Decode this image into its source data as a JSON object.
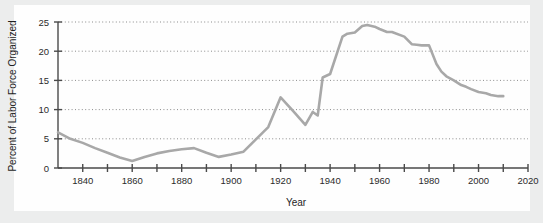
{
  "chart_data": {
    "type": "line",
    "title": "",
    "xlabel": "Year",
    "ylabel": "Percent of Labor Force Organized",
    "xlim": [
      1830,
      2020
    ],
    "ylim": [
      0,
      25
    ],
    "xticks": [
      1840,
      1860,
      1880,
      1900,
      1920,
      1940,
      1960,
      1980,
      2000,
      2020
    ],
    "xtick_labels": [
      "1840",
      "1860",
      "1880",
      "1900",
      "1920",
      "1940",
      "1960",
      "1980",
      "2000",
      "2020"
    ],
    "xminor_step": 10,
    "yticks": [
      0,
      5,
      10,
      15,
      20,
      25
    ],
    "ytick_labels": [
      "0",
      "5",
      "10",
      "15",
      "20",
      "25"
    ],
    "grid": "horizontal-dotted",
    "legend": "none",
    "line_color": "#a8a8a8",
    "line_width": 2.6,
    "axis_color": "#4a4a4a",
    "gridline_color": "#8c8c8c",
    "background_color": "#eceded",
    "plot_background_color": "#fefefe",
    "series": [
      {
        "name": "Percent of Labor Force Organized",
        "x": [
          1830,
          1835,
          1840,
          1845,
          1850,
          1855,
          1860,
          1865,
          1870,
          1875,
          1880,
          1885,
          1890,
          1895,
          1900,
          1905,
          1910,
          1915,
          1920,
          1925,
          1930,
          1933,
          1935,
          1937,
          1940,
          1945,
          1947,
          1950,
          1953,
          1955,
          1958,
          1960,
          1963,
          1965,
          1970,
          1973,
          1975,
          1977,
          1980,
          1983,
          1985,
          1987,
          1990,
          1993,
          1995,
          1997,
          2000,
          2003,
          2005,
          2008,
          2010
        ],
        "y": [
          6.1,
          5.0,
          4.3,
          3.4,
          2.6,
          1.8,
          1.2,
          1.9,
          2.5,
          2.9,
          3.2,
          3.4,
          2.6,
          1.9,
          2.3,
          2.8,
          4.9,
          7.0,
          12.1,
          9.8,
          7.4,
          9.6,
          9.0,
          15.5,
          16.1,
          22.5,
          23.0,
          23.2,
          24.3,
          24.5,
          24.2,
          23.8,
          23.3,
          23.3,
          22.5,
          21.2,
          21.1,
          21.0,
          21.0,
          17.8,
          16.5,
          15.7,
          15.0,
          14.2,
          13.9,
          13.5,
          13.0,
          12.8,
          12.5,
          12.3,
          12.3
        ]
      }
    ]
  },
  "axis": {
    "y_title": "Percent of Labor Force Organized",
    "x_title": "Year"
  }
}
